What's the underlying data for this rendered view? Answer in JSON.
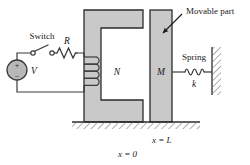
{
  "figure": {
    "background": "#ffffff",
    "width": 250,
    "height": 165
  },
  "colors": {
    "core_fill": "#c9c9c9",
    "core_stroke": "#2b2b2b",
    "block_fill": "#c9c9c9",
    "block_stroke": "#2b2b2b",
    "wire": "#3a3a3a",
    "hatch": "#6e6e6e",
    "text": "#1a1a1a",
    "source_fill": "#b8b8b8"
  },
  "labels": {
    "switch": "Switch",
    "resistor": "R",
    "source": "V",
    "source_plus": "+",
    "source_minus": "−",
    "coil_turns": "N",
    "mass": "M",
    "spring": "Spring",
    "spring_constant": "k",
    "movable_part": "Movable part",
    "position_L": "x = L",
    "position_0": "x = 0"
  },
  "components": {
    "voltage_source": {
      "name": "dc-voltage-source",
      "cx": 17,
      "cy": 70,
      "r": 10
    },
    "switch": {
      "name": "switch",
      "open": true,
      "left_node_x": 33,
      "right_node_x": 51,
      "node_y": 53
    },
    "resistor": {
      "name": "resistor",
      "x": 56,
      "y": 53,
      "zigzags": 4
    },
    "coil": {
      "name": "coil-winding",
      "turns_drawn": 4,
      "x": 84,
      "top_y": 57
    },
    "core": {
      "name": "c-shaped-magnetic-core",
      "shape": "C"
    },
    "movable_block": {
      "name": "movable-mass-block",
      "x": 150,
      "y": 10,
      "w": 22,
      "h": 112
    },
    "spring": {
      "name": "spring",
      "coils": 4,
      "x1": 176,
      "x2": 206,
      "y": 72
    },
    "wall": {
      "name": "fixed-wall",
      "x": 212,
      "top_y": 47,
      "bottom_y": 95
    },
    "ground": {
      "name": "ground-hatching",
      "x": 72,
      "y": 122,
      "w": 128
    }
  }
}
